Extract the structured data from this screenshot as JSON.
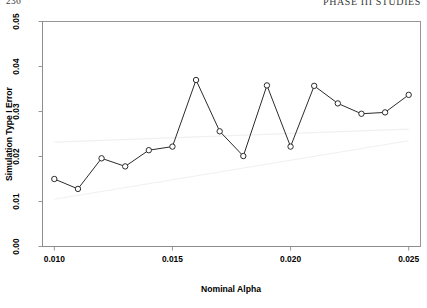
{
  "runhead": {
    "left": "236",
    "right": "Phase III Studies"
  },
  "chart_data": {
    "type": "line",
    "title": "",
    "xlabel": "Nominal Alpha",
    "ylabel": "Simulation Type I Error",
    "xlim": [
      0.0095,
      0.0255
    ],
    "ylim": [
      0.0,
      0.05
    ],
    "xticks": [
      0.01,
      0.015,
      0.02,
      0.025
    ],
    "xtick_labels": [
      "0.010",
      "0.015",
      "0.020",
      "0.025"
    ],
    "yticks": [
      0.0,
      0.01,
      0.02,
      0.03,
      0.04,
      0.05
    ],
    "ytick_labels": [
      "0.00",
      "0.01",
      "0.02",
      "0.03",
      "0.04",
      "0.05"
    ],
    "grid": false,
    "legend": null,
    "marker": "open-circle",
    "x": [
      0.01,
      0.011,
      0.012,
      0.013,
      0.014,
      0.015,
      0.016,
      0.017,
      0.018,
      0.019,
      0.02,
      0.021,
      0.022,
      0.023,
      0.024,
      0.025
    ],
    "values": [
      0.015,
      0.0128,
      0.0196,
      0.0178,
      0.0214,
      0.0222,
      0.037,
      0.0256,
      0.0201,
      0.0358,
      0.0222,
      0.0357,
      0.0318,
      0.0295,
      0.0298,
      0.0337
    ],
    "series": [
      {
        "name": "Simulation Type I Error",
        "values": [
          0.015,
          0.0128,
          0.0196,
          0.0178,
          0.0214,
          0.0222,
          0.037,
          0.0256,
          0.0201,
          0.0358,
          0.0222,
          0.0357,
          0.0318,
          0.0295,
          0.0298,
          0.0337
        ]
      }
    ],
    "reference_bands": [
      {
        "name": "upper-confidence-band",
        "x": [
          0.01,
          0.025
        ],
        "y": [
          0.0232,
          0.0261
        ]
      },
      {
        "name": "lower-confidence-band",
        "x": [
          0.01,
          0.025
        ],
        "y": [
          0.0105,
          0.0235
        ]
      }
    ]
  }
}
